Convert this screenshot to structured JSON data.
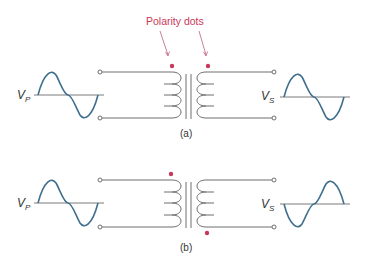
{
  "callout": {
    "label": "Polarity dots",
    "color": "#c8385a"
  },
  "diagrams": [
    {
      "caption": "(a)",
      "primary_label": {
        "main": "V",
        "sub": "P"
      },
      "secondary_label": {
        "main": "V",
        "sub": "S"
      },
      "primary_dot": "top",
      "secondary_dot": "top",
      "primary_wave_phase": "in-phase",
      "secondary_wave_phase": "in-phase"
    },
    {
      "caption": "(b)",
      "primary_label": {
        "main": "V",
        "sub": "P"
      },
      "secondary_label": {
        "main": "V",
        "sub": "S"
      },
      "primary_dot": "top",
      "secondary_dot": "bottom",
      "primary_wave_phase": "in-phase",
      "secondary_wave_phase": "inverted"
    }
  ],
  "colors": {
    "wave": "#3f6f8f",
    "dot": "#c8385a",
    "wire": "#6e6e6e"
  }
}
